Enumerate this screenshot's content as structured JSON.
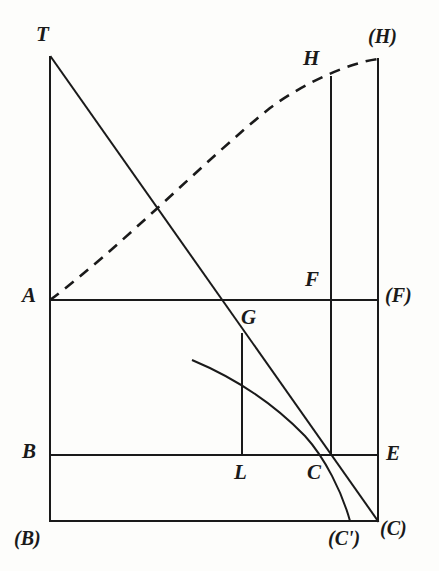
{
  "figure": {
    "stroke_color": "#1a1a1a",
    "background_color": "#fdfdfb",
    "canvas": {
      "width": 439,
      "height": 571
    },
    "labels": [
      {
        "id": "T",
        "text": "T",
        "x": 36,
        "y": 24,
        "kind": "plain"
      },
      {
        "id": "H",
        "text": "H",
        "x": 303,
        "y": 48,
        "kind": "plain"
      },
      {
        "id": "H2",
        "text": "(H)",
        "x": 368,
        "y": 26,
        "kind": "paren"
      },
      {
        "id": "A",
        "text": "A",
        "x": 22,
        "y": 285,
        "kind": "plain"
      },
      {
        "id": "F",
        "text": "F",
        "x": 305,
        "y": 269,
        "kind": "plain"
      },
      {
        "id": "F2",
        "text": "(F)",
        "x": 385,
        "y": 285,
        "kind": "paren"
      },
      {
        "id": "G",
        "text": "G",
        "x": 241,
        "y": 307,
        "kind": "plain"
      },
      {
        "id": "B",
        "text": "B",
        "x": 22,
        "y": 441,
        "kind": "plain"
      },
      {
        "id": "L",
        "text": "L",
        "x": 234,
        "y": 462,
        "kind": "plain"
      },
      {
        "id": "C",
        "text": "C",
        "x": 307,
        "y": 462,
        "kind": "plain"
      },
      {
        "id": "E",
        "text": "E",
        "x": 386,
        "y": 443,
        "kind": "plain"
      },
      {
        "id": "B2",
        "text": "(B)",
        "x": 14,
        "y": 528,
        "kind": "paren"
      },
      {
        "id": "Cp",
        "text": "(C')",
        "x": 328,
        "y": 528,
        "kind": "paren"
      },
      {
        "id": "C2",
        "text": "(C)",
        "x": 380,
        "y": 518,
        "kind": "paren"
      }
    ],
    "segments": [
      {
        "id": "left-vertical-T-B",
        "x1": 50,
        "y1": 57,
        "x2": 50,
        "y2": 521,
        "style": "solid"
      },
      {
        "id": "bottom-horizontal",
        "x1": 50,
        "y1": 521,
        "x2": 378,
        "y2": 521,
        "style": "solid"
      },
      {
        "id": "horizontal-A-F",
        "x1": 50,
        "y1": 300,
        "x2": 378,
        "y2": 300,
        "style": "solid"
      },
      {
        "id": "horizontal-B-E",
        "x1": 50,
        "y1": 455,
        "x2": 378,
        "y2": 455,
        "style": "solid"
      },
      {
        "id": "vertical-H-C",
        "x1": 331,
        "y1": 77,
        "x2": 331,
        "y2": 455,
        "style": "solid"
      },
      {
        "id": "right-vertical-Hp-Cp",
        "x1": 378,
        "y1": 59,
        "x2": 378,
        "y2": 521,
        "style": "solid"
      },
      {
        "id": "vertical-G-L",
        "x1": 242,
        "y1": 334,
        "x2": 242,
        "y2": 455,
        "style": "solid"
      },
      {
        "id": "straight-line-T-C",
        "x1": 51,
        "y1": 57,
        "x2": 378,
        "y2": 521,
        "style": "solid"
      }
    ],
    "curves": [
      {
        "id": "dashed-curve-A-H",
        "style": "dashed",
        "dash_pattern": "11 8",
        "path": "M 50 300 C 120 248 205 160 270 108 C 305 82 352 62 378 59"
      },
      {
        "id": "solid-curve-to-Cprime",
        "style": "solid",
        "path": "M 192 360 C 235 378 275 405 305 436 C 325 458 342 492 350 521"
      }
    ]
  }
}
